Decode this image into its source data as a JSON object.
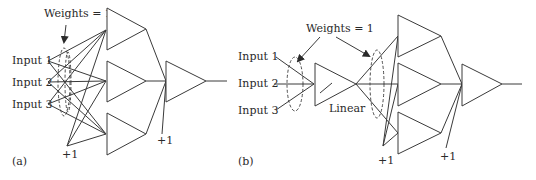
{
  "panel_a": {
    "label": "(a)",
    "weights_label": "Weights = 1",
    "inputs": [
      "Input 1",
      "Input 2",
      "Input 3"
    ],
    "hidden_bias_label": "+1",
    "output_bias_label": "+1",
    "hidden_units": 3,
    "output_units": 1
  },
  "panel_b": {
    "label": "(b)",
    "weights_label": "Weights = 1",
    "inputs": [
      "Input 1",
      "Input 2",
      "Input 3"
    ],
    "linear_label": "Linear",
    "hidden_bias_label": "+1",
    "output_bias_label": "+1",
    "hidden_units": 3,
    "output_units": 1
  }
}
